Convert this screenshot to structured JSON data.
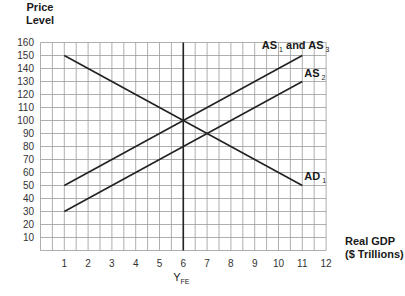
{
  "chart_data": {
    "type": "line",
    "title": "",
    "xlabel": "Real GDP ($ Trillions)",
    "ylabel": "Price Level",
    "xlabel_lines": [
      "Real GDP",
      "($ Trillions)"
    ],
    "ylabel_lines": [
      "Price",
      "Level"
    ],
    "xlim": [
      0,
      12
    ],
    "ylim": [
      0,
      160
    ],
    "x_ticks": [
      1,
      2,
      3,
      4,
      5,
      6,
      7,
      8,
      9,
      10,
      11,
      12
    ],
    "y_ticks": [
      10,
      20,
      30,
      40,
      50,
      60,
      70,
      80,
      90,
      100,
      110,
      120,
      130,
      140,
      150,
      160
    ],
    "grid": true,
    "x_grid_step": 0.5,
    "y_grid_step": 10,
    "legend": "inline labels at line ends",
    "series": [
      {
        "name": "AD1",
        "label": "AD",
        "subscript": "1",
        "x": [
          1,
          11
        ],
        "y": [
          150,
          50
        ]
      },
      {
        "name": "AS1 and AS3",
        "label": "AS",
        "subscript": "1",
        "label_mid": " and AS",
        "subscript2": "3",
        "x": [
          1,
          11
        ],
        "y": [
          50,
          150
        ]
      },
      {
        "name": "AS2",
        "label": "AS",
        "subscript": "2",
        "x": [
          1,
          11
        ],
        "y": [
          30,
          130
        ]
      }
    ],
    "annotations": [
      {
        "type": "vertical_line",
        "x": 6,
        "label": "Y",
        "subscript": "FE"
      }
    ]
  }
}
